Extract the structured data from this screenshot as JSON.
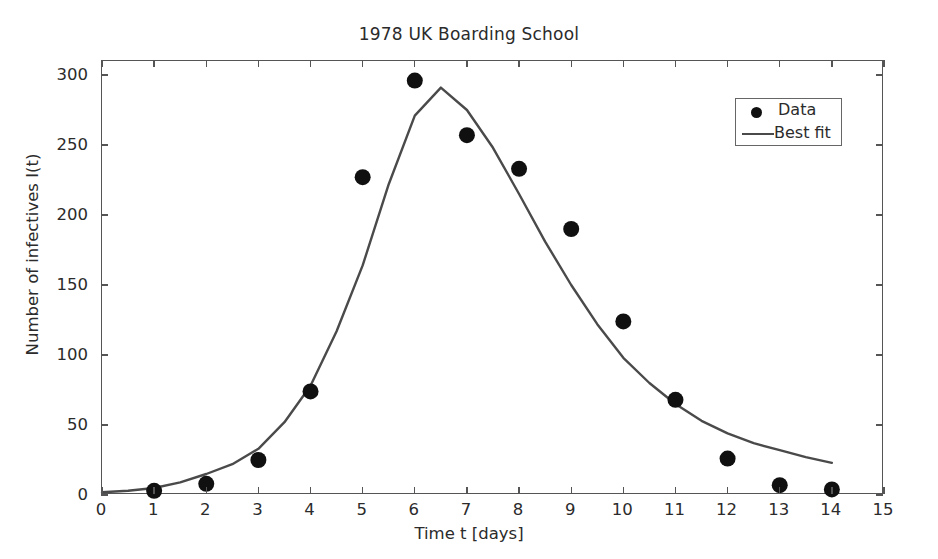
{
  "chart_data": {
    "type": "scatter",
    "title": "1978 UK Boarding School",
    "xlabel": "Time t [days]",
    "ylabel": "Number of infectives I(t)",
    "xlim": [
      0,
      15
    ],
    "ylim": [
      0,
      310
    ],
    "xticks": [
      0,
      1,
      2,
      3,
      4,
      5,
      6,
      7,
      8,
      9,
      10,
      11,
      12,
      13,
      14,
      15
    ],
    "yticks": [
      0,
      50,
      100,
      150,
      200,
      250,
      300
    ],
    "grid": false,
    "legend_position": "upper right",
    "series": [
      {
        "name": "Data",
        "type": "scatter",
        "marker": "circle",
        "color": "#101010",
        "x": [
          0,
          1,
          2,
          3,
          4,
          5,
          6,
          7,
          8,
          9,
          10,
          11,
          12,
          13,
          14
        ],
        "y": [
          1,
          3,
          8,
          25,
          74,
          227,
          296,
          257,
          233,
          190,
          124,
          68,
          26,
          7,
          4
        ]
      },
      {
        "name": "Best fit",
        "type": "line",
        "color": "#4a4a4a",
        "x": [
          0,
          0.5,
          1,
          1.5,
          2,
          2.5,
          3,
          3.5,
          4,
          4.5,
          5,
          5.5,
          6,
          6.5,
          7,
          7.5,
          8,
          8.5,
          9,
          9.5,
          10,
          10.5,
          11,
          11.5,
          12,
          12.5,
          13,
          13.5,
          14
        ],
        "y": [
          2,
          3,
          5,
          9,
          15,
          22,
          33,
          52,
          78,
          117,
          164,
          222,
          271,
          291,
          275,
          248,
          215,
          181,
          150,
          122,
          98,
          80,
          65,
          53,
          44,
          37,
          32,
          27,
          23
        ]
      }
    ]
  },
  "legend": {
    "entries": [
      {
        "label": "Data",
        "marker": "data-point-marker"
      },
      {
        "label": "Best fit",
        "marker": "best-fit-line-marker"
      }
    ]
  },
  "colors": {
    "data_marker": "#101010",
    "fit_line": "#4a4a4a",
    "axis": "#555555",
    "text": "#2b2b2b",
    "background": "#ffffff"
  }
}
